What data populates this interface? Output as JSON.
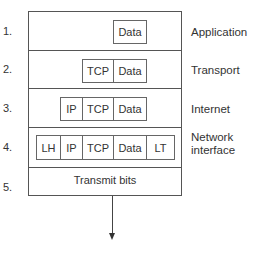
{
  "diagram": {
    "layers": [
      {
        "number": "1.",
        "name": "Application",
        "cells": [
          "Data"
        ]
      },
      {
        "number": "2.",
        "name": "Transport",
        "cells": [
          "TCP",
          "Data"
        ]
      },
      {
        "number": "3.",
        "name": "Internet",
        "cells": [
          "IP",
          "TCP",
          "Data"
        ]
      },
      {
        "number": "4.",
        "name_line1": "Network",
        "name_line2": "interface",
        "cells": [
          "LH",
          "IP",
          "TCP",
          "Data",
          "LT"
        ]
      },
      {
        "number": "5.",
        "text": "Transmit bits"
      }
    ],
    "colors": {
      "line": "#555555",
      "text": "#333333",
      "background": "#ffffff"
    }
  }
}
